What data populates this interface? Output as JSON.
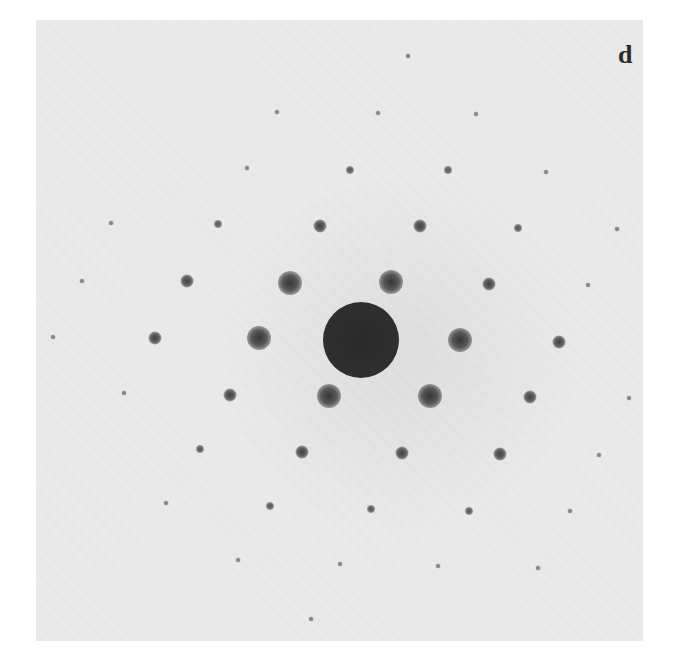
{
  "figure": {
    "panel_label": "d",
    "background_color": "#ebebeb",
    "spot_color": "#2b2b2b"
  },
  "spots": [
    {
      "x": 408,
      "y": 56,
      "size": "tiny"
    },
    {
      "x": 277,
      "y": 112,
      "size": "tiny"
    },
    {
      "x": 378,
      "y": 113,
      "size": "tiny"
    },
    {
      "x": 476,
      "y": 114,
      "size": "tiny"
    },
    {
      "x": 247,
      "y": 168,
      "size": "tiny"
    },
    {
      "x": 350,
      "y": 170,
      "size": "small"
    },
    {
      "x": 448,
      "y": 170,
      "size": "small"
    },
    {
      "x": 546,
      "y": 172,
      "size": "tiny"
    },
    {
      "x": 111,
      "y": 223,
      "size": "tiny"
    },
    {
      "x": 218,
      "y": 224,
      "size": "small"
    },
    {
      "x": 320,
      "y": 226,
      "size": "medium"
    },
    {
      "x": 420,
      "y": 226,
      "size": "medium"
    },
    {
      "x": 518,
      "y": 228,
      "size": "small"
    },
    {
      "x": 617,
      "y": 229,
      "size": "tiny"
    },
    {
      "x": 82,
      "y": 281,
      "size": "tiny"
    },
    {
      "x": 187,
      "y": 281,
      "size": "medium"
    },
    {
      "x": 290,
      "y": 283,
      "size": "large"
    },
    {
      "x": 391,
      "y": 282,
      "size": "large"
    },
    {
      "x": 489,
      "y": 284,
      "size": "medium"
    },
    {
      "x": 588,
      "y": 285,
      "size": "tiny"
    },
    {
      "x": 53,
      "y": 337,
      "size": "tiny"
    },
    {
      "x": 155,
      "y": 338,
      "size": "medium"
    },
    {
      "x": 259,
      "y": 338,
      "size": "large"
    },
    {
      "x": 460,
      "y": 340,
      "size": "large"
    },
    {
      "x": 559,
      "y": 342,
      "size": "medium"
    },
    {
      "x": 124,
      "y": 393,
      "size": "tiny"
    },
    {
      "x": 230,
      "y": 395,
      "size": "medium"
    },
    {
      "x": 329,
      "y": 396,
      "size": "large"
    },
    {
      "x": 430,
      "y": 396,
      "size": "large"
    },
    {
      "x": 530,
      "y": 397,
      "size": "medium"
    },
    {
      "x": 629,
      "y": 398,
      "size": "tiny"
    },
    {
      "x": 200,
      "y": 449,
      "size": "small"
    },
    {
      "x": 302,
      "y": 452,
      "size": "medium"
    },
    {
      "x": 402,
      "y": 453,
      "size": "medium"
    },
    {
      "x": 500,
      "y": 454,
      "size": "medium"
    },
    {
      "x": 599,
      "y": 455,
      "size": "tiny"
    },
    {
      "x": 166,
      "y": 503,
      "size": "tiny"
    },
    {
      "x": 270,
      "y": 506,
      "size": "small"
    },
    {
      "x": 371,
      "y": 509,
      "size": "small"
    },
    {
      "x": 469,
      "y": 511,
      "size": "small"
    },
    {
      "x": 570,
      "y": 511,
      "size": "tiny"
    },
    {
      "x": 238,
      "y": 560,
      "size": "tiny"
    },
    {
      "x": 340,
      "y": 564,
      "size": "tiny"
    },
    {
      "x": 438,
      "y": 566,
      "size": "tiny"
    },
    {
      "x": 538,
      "y": 568,
      "size": "tiny"
    },
    {
      "x": 311,
      "y": 619,
      "size": "tiny"
    }
  ],
  "central_beam": {
    "x": 361,
    "y": 340,
    "radius": 33
  }
}
